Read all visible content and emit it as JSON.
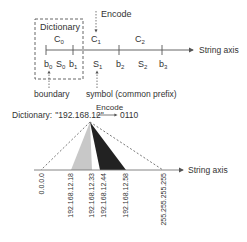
{
  "top": {
    "dictionary_label": "Dictionary",
    "encode_label": "Encode",
    "axis_label": "String axis",
    "codes": [
      {
        "label": "C",
        "sub": "0"
      },
      {
        "label": "C",
        "sub": "1"
      },
      {
        "label": "C",
        "sub": "2"
      }
    ],
    "boundaries": [
      {
        "label": "b",
        "sub": "0"
      },
      {
        "label": "b",
        "sub": "1"
      },
      {
        "label": "b",
        "sub": "2"
      },
      {
        "label": "b",
        "sub": "3"
      }
    ],
    "symbols": [
      {
        "label": "S",
        "sub": "0"
      },
      {
        "label": "S",
        "sub": "1"
      },
      {
        "label": "S",
        "sub": "2"
      }
    ],
    "boundary_caption": "boundary",
    "symbol_caption": "symbol (common prefix)"
  },
  "bottom": {
    "dictionary_prefix": "Dictionary:",
    "dictionary_value": "\"192.168.12\"",
    "encode_label": "Encode",
    "code": "0110",
    "axis_label": "String axis",
    "ticks": [
      "0.0.0.0",
      "192.168.12.18",
      "192.168.12.33",
      "192.168.12.44",
      "192.168.12.58",
      "255.255.255.255"
    ],
    "colors": {
      "light_wedge": "#c8c8c8",
      "dark_wedge": "#222222",
      "line": "#555555"
    }
  }
}
